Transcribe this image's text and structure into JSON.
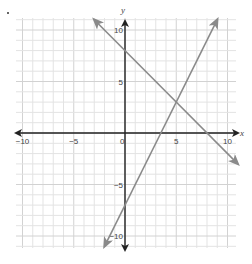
{
  "chart_data": {
    "type": "line",
    "title": "",
    "xlabel": "x",
    "ylabel": "y",
    "xlim": [
      -10.5,
      10.9
    ],
    "ylim": [
      -11.2,
      11.1
    ],
    "grid": true,
    "x_ticks": [
      -10,
      -5,
      0,
      5,
      10
    ],
    "y_ticks": [
      10,
      5,
      -5,
      -10
    ],
    "x_tick_labels": [
      "−10",
      "−5",
      "0",
      "5",
      "10"
    ],
    "y_tick_labels": [
      "10",
      "5",
      "−5",
      "−10"
    ],
    "series": [
      {
        "name": "y = -x + 8",
        "slope": -1,
        "intercept": 8,
        "x": [
          -3,
          11
        ],
        "y": [
          11,
          -3
        ],
        "color": "#8a8a8a",
        "arrows": "both"
      },
      {
        "name": "y = 2x - 7",
        "slope": 2,
        "intercept": -7,
        "x": [
          -2,
          9
        ],
        "y": [
          -11,
          11
        ],
        "color": "#8a8a8a",
        "arrows": "both"
      }
    ],
    "intersection": {
      "x": 5,
      "y": 3
    },
    "legend": "none"
  },
  "layout": {
    "origin_px": [
      125,
      133
    ],
    "unit_px_x": 10.25,
    "unit_px_y": 10.3,
    "grid_box": {
      "left": 16,
      "top": 18,
      "right": 236,
      "bottom": 248
    },
    "grid_color": "#e3e3e3",
    "major_grid_color": "#d2d2d2",
    "axis_color": "#222222",
    "line_color": "#8a8a8a"
  }
}
